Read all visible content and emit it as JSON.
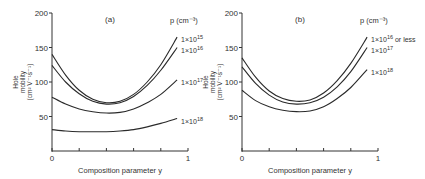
{
  "chart_data": [
    {
      "type": "line",
      "panel_label": "(a)",
      "title": "",
      "xlabel": "Composition parameter y",
      "ylabel": "Hole mobility (cm² V⁻¹ s⁻¹)",
      "ylabel_lines": [
        "Hole",
        "mobility",
        "(cm² V⁻¹s⁻¹)"
      ],
      "xlim": [
        0,
        1
      ],
      "ylim": [
        0,
        200
      ],
      "x_ticks": [
        0,
        0.2,
        0.4,
        0.6,
        0.8,
        1
      ],
      "x_tick_labels": [
        "0",
        "",
        "",
        "",
        "",
        "1"
      ],
      "y_ticks": [
        50,
        100,
        150,
        200
      ],
      "y_tick_labels": [
        "50",
        "100",
        "150",
        "200"
      ],
      "grid": false,
      "legend_title": "p (cm⁻³)",
      "x": [
        0,
        0.1,
        0.2,
        0.3,
        0.4,
        0.5,
        0.6,
        0.7,
        0.8,
        0.92
      ],
      "series": [
        {
          "name": "1×10¹⁵",
          "label_base": "1×10",
          "label_exp": "15",
          "values": [
            140,
            110,
            88,
            75,
            70,
            72,
            82,
            100,
            125,
            165
          ]
        },
        {
          "name": "1×10¹⁶",
          "label_base": "1×10",
          "label_exp": "16",
          "values": [
            124,
            100,
            83,
            72,
            68,
            70,
            79,
            95,
            117,
            150
          ]
        },
        {
          "name": "1×10¹⁷",
          "label_base": "1×10",
          "label_exp": "17",
          "values": [
            78,
            68,
            61,
            57,
            55,
            56,
            61,
            70,
            82,
            103
          ]
        },
        {
          "name": "1×10¹⁸",
          "label_base": "1×10",
          "label_exp": "18",
          "values": [
            31,
            29,
            28,
            28,
            28,
            29,
            31,
            35,
            40,
            47
          ]
        }
      ]
    },
    {
      "type": "line",
      "panel_label": "(b)",
      "title": "",
      "xlabel": "Composition parameter y",
      "ylabel": "Hole mobility (cm² V⁻¹ s⁻¹)",
      "ylabel_lines": [
        "Hole",
        "mobility",
        "(cm² V⁻¹s⁻¹)"
      ],
      "xlim": [
        0,
        1
      ],
      "ylim": [
        0,
        200
      ],
      "x_ticks": [
        0,
        0.2,
        0.4,
        0.6,
        0.8,
        1
      ],
      "x_tick_labels": [
        "0",
        "",
        "",
        "",
        "",
        "1"
      ],
      "y_ticks": [
        50,
        100,
        150,
        200
      ],
      "y_tick_labels": [
        "50",
        "100",
        "150",
        "200"
      ],
      "grid": false,
      "legend_title": "p (cm⁻³)",
      "x": [
        0,
        0.1,
        0.2,
        0.3,
        0.4,
        0.5,
        0.6,
        0.7,
        0.8,
        0.92
      ],
      "series": [
        {
          "name": "1×10¹⁶ or less",
          "label_base": "1×10",
          "label_exp": "16",
          "label_suffix": " or less",
          "values": [
            135,
            107,
            87,
            76,
            72,
            74,
            84,
            102,
            127,
            165
          ]
        },
        {
          "name": "1×10¹⁷",
          "label_base": "1×10",
          "label_exp": "17",
          "values": [
            122,
            98,
            81,
            71,
            68,
            70,
            78,
            93,
            115,
            150
          ]
        },
        {
          "name": "1×10¹⁸",
          "label_base": "1×10",
          "label_exp": "18",
          "values": [
            88,
            73,
            64,
            59,
            57,
            58,
            64,
            76,
            92,
            118
          ]
        }
      ]
    }
  ]
}
